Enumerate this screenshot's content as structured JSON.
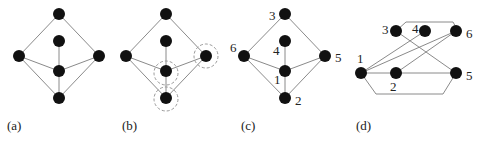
{
  "panels": [
    {
      "id": "a",
      "caption": "(a)",
      "nodes": [
        {
          "id": "top",
          "label": ""
        },
        {
          "id": "inner",
          "label": ""
        },
        {
          "id": "left",
          "label": ""
        },
        {
          "id": "right",
          "label": ""
        },
        {
          "id": "center",
          "label": ""
        },
        {
          "id": "bottom",
          "label": ""
        }
      ],
      "edges": [
        [
          "top",
          "left"
        ],
        [
          "top",
          "right"
        ],
        [
          "inner",
          "center"
        ],
        [
          "left",
          "center"
        ],
        [
          "right",
          "center"
        ],
        [
          "center",
          "bottom"
        ],
        [
          "left",
          "bottom"
        ],
        [
          "right",
          "bottom"
        ]
      ],
      "highlighted": []
    },
    {
      "id": "b",
      "caption": "(b)",
      "nodes": [
        {
          "id": "top",
          "label": ""
        },
        {
          "id": "inner",
          "label": ""
        },
        {
          "id": "left",
          "label": ""
        },
        {
          "id": "right",
          "label": ""
        },
        {
          "id": "center",
          "label": ""
        },
        {
          "id": "bottom",
          "label": ""
        }
      ],
      "edges": [
        [
          "top",
          "left"
        ],
        [
          "top",
          "right"
        ],
        [
          "inner",
          "center"
        ],
        [
          "left",
          "center"
        ],
        [
          "right",
          "center"
        ],
        [
          "center",
          "bottom"
        ],
        [
          "left",
          "bottom"
        ],
        [
          "right",
          "bottom"
        ]
      ],
      "highlighted": [
        "right",
        "center",
        "bottom"
      ]
    },
    {
      "id": "c",
      "caption": "(c)",
      "nodes": [
        {
          "id": "top",
          "label": "3"
        },
        {
          "id": "inner",
          "label": "4"
        },
        {
          "id": "left",
          "label": "6"
        },
        {
          "id": "right",
          "label": "5"
        },
        {
          "id": "center",
          "label": "1"
        },
        {
          "id": "bottom",
          "label": "2"
        }
      ],
      "edges": [
        [
          "top",
          "left"
        ],
        [
          "top",
          "right"
        ],
        [
          "inner",
          "center"
        ],
        [
          "left",
          "center"
        ],
        [
          "right",
          "center"
        ],
        [
          "center",
          "bottom"
        ],
        [
          "left",
          "bottom"
        ],
        [
          "right",
          "bottom"
        ]
      ],
      "highlighted": []
    },
    {
      "id": "d",
      "caption": "(d)",
      "nodes": [
        {
          "id": "n3",
          "label": "3"
        },
        {
          "id": "n4",
          "label": "4"
        },
        {
          "id": "n6",
          "label": "6"
        },
        {
          "id": "n1",
          "label": "1"
        },
        {
          "id": "n2",
          "label": "2"
        },
        {
          "id": "n5",
          "label": "5"
        }
      ],
      "edges": [
        [
          "n3",
          "n6"
        ],
        [
          "n3",
          "n5"
        ],
        [
          "n1",
          "n4"
        ],
        [
          "n1",
          "n6"
        ],
        [
          "n2",
          "n6"
        ],
        [
          "n1",
          "n2"
        ],
        [
          "n2",
          "n5"
        ],
        [
          "n1",
          "n5"
        ]
      ],
      "highlighted": []
    }
  ]
}
